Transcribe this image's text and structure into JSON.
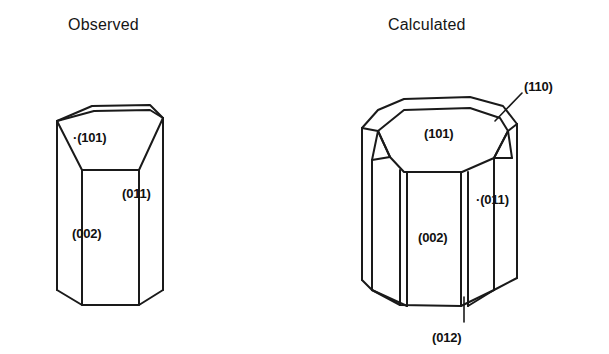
{
  "figure": {
    "caption_type": "crystal-morphology-comparison",
    "background_color": "#ffffff",
    "line_color": "#1a1a1a"
  },
  "panels": [
    {
      "id": "observed",
      "title": "Observed",
      "labels": [
        {
          "id": "o-101",
          "text": "·(101)"
        },
        {
          "id": "o-011",
          "text": "(011)"
        },
        {
          "id": "o-002",
          "text": "(002)"
        }
      ]
    },
    {
      "id": "calculated",
      "title": "Calculated",
      "labels": [
        {
          "id": "c-110",
          "text": "(110)"
        },
        {
          "id": "c-101",
          "text": "(101)"
        },
        {
          "id": "c-011",
          "text": "·(011)"
        },
        {
          "id": "c-002",
          "text": "(002)"
        },
        {
          "id": "c-012",
          "text": "(012)"
        }
      ]
    }
  ]
}
